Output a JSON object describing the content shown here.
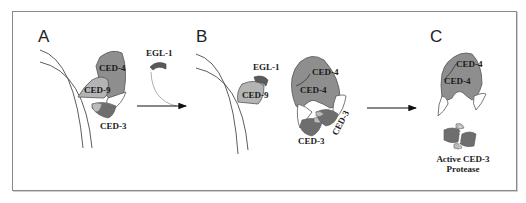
{
  "figure": {
    "colors": {
      "frame": "#8a8a8a",
      "ced4": "#8e8e8e",
      "ced9": "#b4b4b4",
      "ced3_dark": "#6e6e6e",
      "ced3_light": "#bcbcbc",
      "egl1": "#5a5a5a",
      "arrow": "#111111"
    },
    "panels": [
      {
        "letter": "A",
        "proteins": {
          "ced4": "CED-4",
          "ced9": "CED-9",
          "ced3": "CED-3",
          "egl1": "EGL-1"
        }
      },
      {
        "letter": "B",
        "proteins": {
          "egl1": "EGL-1",
          "ced9": "CED-9",
          "ced4_top": "CED-4",
          "ced4_bottom": "CED-4",
          "ced3_left": "CED-3",
          "ced3_right": "CED-3"
        }
      },
      {
        "letter": "C",
        "proteins": {
          "ced4_top": "CED-4",
          "ced4_bottom": "CED-4"
        },
        "caption_line1": "Active CED-3",
        "caption_line2": "Protease"
      }
    ]
  }
}
